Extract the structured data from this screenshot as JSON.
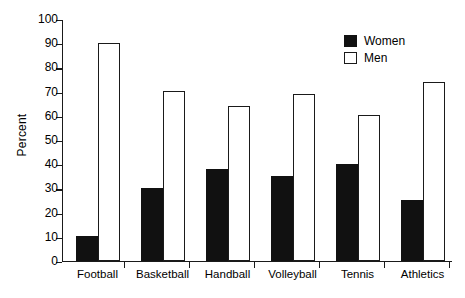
{
  "chart_data": {
    "type": "bar",
    "title": "",
    "subtitle": "",
    "xlabel": "",
    "ylabel": "Percent",
    "ylim": [
      0,
      100
    ],
    "ytick_step": 10,
    "yticks": [
      0,
      10,
      20,
      30,
      40,
      50,
      60,
      70,
      80,
      90,
      100
    ],
    "ytick_labels": [
      "0",
      "10",
      "20",
      "30",
      "40",
      "50",
      "60",
      "70",
      "80",
      "90",
      "100"
    ],
    "categories": [
      "Football",
      "Basketball",
      "Handball",
      "Volleyball",
      "Tennis",
      "Athletics"
    ],
    "series": [
      {
        "name": "Women",
        "style": "filled-black",
        "color": "#111111",
        "values": [
          10,
          30,
          38,
          35,
          40,
          25
        ]
      },
      {
        "name": "Men",
        "style": "hollow-white",
        "color": "#ffffff",
        "edge_color": "#1a1a1a",
        "values": [
          90,
          70,
          64,
          69,
          60,
          74
        ]
      }
    ],
    "legend": {
      "position": "top-right",
      "entries": [
        "Women",
        "Men"
      ]
    },
    "grid": false,
    "axis_color": "#1a1a1a",
    "background": "#ffffff"
  }
}
